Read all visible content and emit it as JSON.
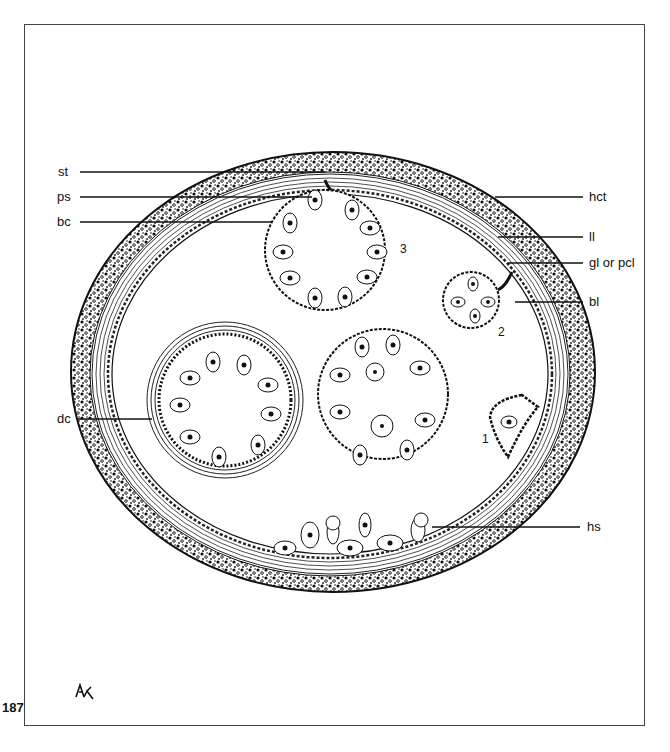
{
  "figure": {
    "page_number": "187",
    "signature": "AK",
    "labels_left": [
      {
        "id": "st",
        "text": "st",
        "y": 172
      },
      {
        "id": "ps",
        "text": "ps",
        "y": 197
      },
      {
        "id": "bc",
        "text": "bc",
        "y": 222
      },
      {
        "id": "dc",
        "text": "dc",
        "y": 419
      }
    ],
    "labels_right": [
      {
        "id": "hct",
        "text": "hct",
        "y": 197
      },
      {
        "id": "ll",
        "text": "ll",
        "y": 237
      },
      {
        "id": "gl",
        "text": "gl or pcl",
        "y": 263
      },
      {
        "id": "bl",
        "text": "bl",
        "y": 302
      },
      {
        "id": "hs",
        "text": "hs",
        "y": 527
      }
    ],
    "stage_numbers": [
      {
        "id": "stage-1",
        "text": "1"
      },
      {
        "id": "stage-2",
        "text": "2"
      },
      {
        "id": "stage-3",
        "text": "3"
      }
    ],
    "colors": {
      "ink": "#111111",
      "frame": "#444444",
      "background": "#ffffff"
    }
  }
}
